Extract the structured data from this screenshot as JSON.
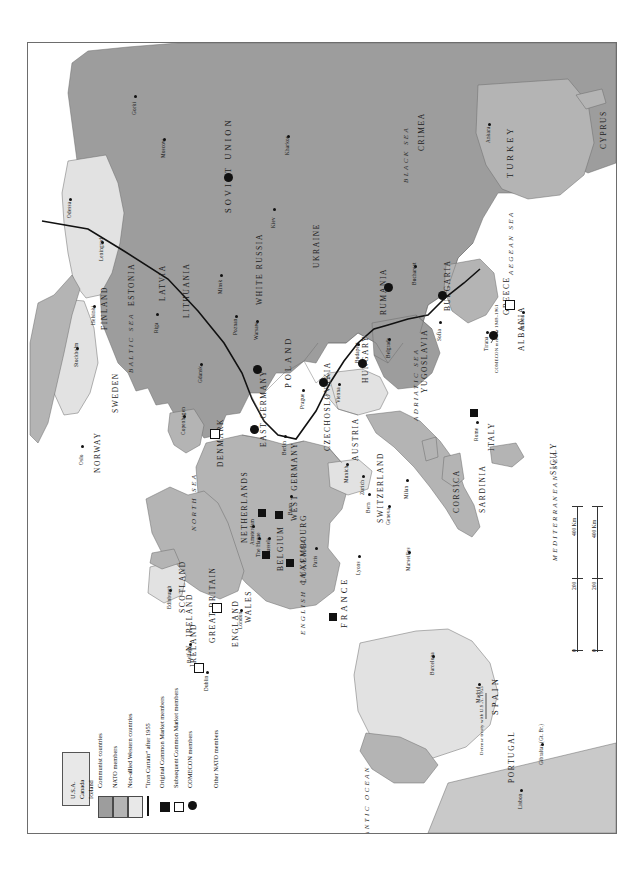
{
  "map": {
    "title": "Cold War Europe",
    "frame": {
      "border_color": "#6d6d6d"
    },
    "colors": {
      "communist": "#9d9d9d",
      "nato": "#b4b4b4",
      "neutral": "#e2e2e2",
      "other_land": "#c9c9c9",
      "sea": "#ffffff",
      "ink": "#111111"
    }
  },
  "legend": {
    "items": [
      {
        "label": "Communist countries",
        "swatch": "communist"
      },
      {
        "label": "NATO members",
        "swatch": "nato"
      },
      {
        "label": "Non-allied Western countries",
        "swatch": "neutral"
      },
      {
        "label": "“Iron Curtain” after 1955",
        "swatch": "bar"
      },
      {
        "label": "Original Common Market members",
        "swatch": "sq-filled"
      },
      {
        "label": "Subsequent Common Market members",
        "swatch": "sq-open"
      },
      {
        "label": "COMECON members",
        "swatch": "circ"
      },
      {
        "label": "Other NATO members",
        "swatch": "none"
      }
    ],
    "other_nato_box": {
      "lines": [
        "U.S.A.",
        "Canada",
        "Iceland"
      ]
    }
  },
  "scale": {
    "unit_top": "400 Km",
    "unit_bottom": "400 Km",
    "ticks_top": [
      "0",
      "200",
      "400 Km"
    ],
    "ticks_bottom": [
      "0",
      "200",
      "400 Km"
    ]
  },
  "countries": [
    {
      "name": "SOVIET UNION",
      "group": "communist"
    },
    {
      "name": "WHITE RUSSIA",
      "group": "communist"
    },
    {
      "name": "UKRAINE",
      "group": "communist"
    },
    {
      "name": "ESTONIA",
      "group": "communist"
    },
    {
      "name": "LATVIA",
      "group": "communist"
    },
    {
      "name": "LITHUANIA",
      "group": "communist"
    },
    {
      "name": "POLAND",
      "group": "communist"
    },
    {
      "name": "EAST GERMANY",
      "group": "communist"
    },
    {
      "name": "CZECHOSLOVAKIA",
      "group": "communist"
    },
    {
      "name": "HUNGARY",
      "group": "communist"
    },
    {
      "name": "RUMANIA",
      "group": "communist"
    },
    {
      "name": "BULGARIA",
      "group": "communist"
    },
    {
      "name": "YUGOSLAVIA",
      "group": "communist"
    },
    {
      "name": "ALBANIA",
      "group": "communist"
    },
    {
      "name": "CRIMEA",
      "group": "communist"
    },
    {
      "name": "FINLAND",
      "group": "neutral"
    },
    {
      "name": "SWEDEN",
      "group": "neutral"
    },
    {
      "name": "AUSTRIA",
      "group": "neutral"
    },
    {
      "name": "SWITZERLAND",
      "group": "neutral"
    },
    {
      "name": "SPAIN",
      "group": "neutral"
    },
    {
      "name": "IRELAND",
      "group": "neutral"
    },
    {
      "name": "NORWAY",
      "group": "nato"
    },
    {
      "name": "DENMARK",
      "group": "nato"
    },
    {
      "name": "WEST GERMANY",
      "group": "nato"
    },
    {
      "name": "NETHERLANDS",
      "group": "nato"
    },
    {
      "name": "BELGIUM",
      "group": "nato"
    },
    {
      "name": "LUXEMBOURG",
      "group": "nato"
    },
    {
      "name": "FRANCE",
      "group": "nato"
    },
    {
      "name": "GREAT BRITAIN",
      "group": "nato"
    },
    {
      "name": "SCOTLAND",
      "group": "nato"
    },
    {
      "name": "ENGLAND",
      "group": "nato"
    },
    {
      "name": "WALES",
      "group": "nato"
    },
    {
      "name": "N. IRELAND",
      "group": "nato"
    },
    {
      "name": "PORTUGAL",
      "group": "nato"
    },
    {
      "name": "ITALY",
      "group": "nato"
    },
    {
      "name": "GREECE",
      "group": "nato"
    },
    {
      "name": "TURKEY",
      "group": "nato"
    },
    {
      "name": "SICILY",
      "group": "nato"
    },
    {
      "name": "SARDINIA",
      "group": "nato"
    },
    {
      "name": "CORSICA",
      "group": "nato"
    },
    {
      "name": "CYPRUS",
      "group": "nato"
    }
  ],
  "seas": [
    "BLACK SEA",
    "AEGEAN SEA",
    "MEDITERRANEAN SEA",
    "ADRIATIC SEA",
    "BALTIC SEA",
    "NORTH SEA",
    "ENGLISH CHANNEL",
    "ATLANTIC OCEAN"
  ],
  "cities": [
    "Gorki",
    "Moscow",
    "Kharkov",
    "Ankara",
    "Odessa",
    "Leningrad",
    "Kiev",
    "Helsinki",
    "Stockholm",
    "Riga",
    "Minsk",
    "Oslo",
    "Copenhagen",
    "Gdansk",
    "Warsaw",
    "Poznan",
    "Prague",
    "Vienna",
    "Budapest",
    "Belgrade",
    "Bucharest",
    "Sofia",
    "Athens",
    "Tirana",
    "Rome",
    "Berlin",
    "Bonn",
    "Munich",
    "Zurich",
    "Bern",
    "Geneva",
    "Brussels",
    "Amsterdam",
    "The Hague",
    "Paris",
    "Lyons",
    "Marseilles",
    "Milan",
    "London",
    "Edinburgh",
    "Belfast",
    "Dublin",
    "Madrid",
    "Barcelona",
    "Lisbon",
    "Gibraltar (Gt. Br.)"
  ],
  "annotations": [
    {
      "text": "COMECON member 1949–1961",
      "anchor": "ALBANIA"
    },
    {
      "text": "Defense treaty with U.S.A. 1953",
      "anchor": "SPAIN"
    }
  ],
  "markers": {
    "original_common_market": [
      "WEST GERMANY",
      "FRANCE",
      "ITALY",
      "BELGIUM",
      "NETHERLANDS",
      "LUXEMBOURG"
    ],
    "subsequent_common_market": [
      "GREAT BRITAIN",
      "IRELAND",
      "DENMARK",
      "GREECE"
    ],
    "comecon": [
      "SOVIET UNION",
      "POLAND",
      "EAST GERMANY",
      "CZECHOSLOVAKIA",
      "HUNGARY",
      "RUMANIA",
      "BULGARIA",
      "ALBANIA"
    ]
  }
}
